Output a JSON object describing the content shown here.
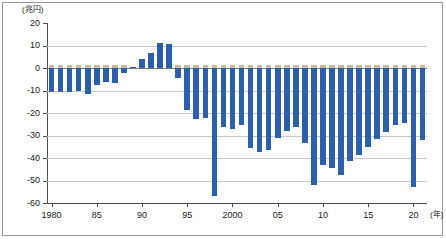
{
  "figure": {
    "unit_label": "(兆円)",
    "x_unit_label": "(年)"
  },
  "axes": {
    "y_ticks": [
      20,
      10,
      0,
      -10,
      -20,
      -30,
      -40,
      -50,
      -60
    ],
    "y_tick_labels": [
      "20",
      "10",
      "0",
      "-10",
      "-20",
      "-30",
      "-40",
      "-50",
      "-60"
    ],
    "x_tick_labels": [
      "1980",
      "85",
      "90",
      "95",
      "2000",
      "05",
      "10",
      "15",
      "20"
    ],
    "x_tick_years": [
      1980,
      1985,
      1990,
      1995,
      2000,
      2005,
      2010,
      2015,
      2020
    ]
  },
  "colors": {
    "bar": "#2b5faa",
    "grid": "#c9c9c9",
    "axis": "#4d4d4d",
    "frame": "#9a9a9a",
    "background": "#ffffff"
  },
  "chart_data": {
    "type": "bar",
    "title": "",
    "subtitle": "",
    "xlabel": "(年)",
    "ylabel": "(兆円)",
    "ylim": [
      -60,
      20
    ],
    "grid": true,
    "legend": "none",
    "categories": [
      "1980",
      "1981",
      "1982",
      "1983",
      "1984",
      "1985",
      "1986",
      "1987",
      "1988",
      "1989",
      "1990",
      "1991",
      "1992",
      "1993",
      "1994",
      "1995",
      "1996",
      "1997",
      "1998",
      "1999",
      "2000",
      "2001",
      "2002",
      "2003",
      "2004",
      "2005",
      "2006",
      "2007",
      "2008",
      "2009",
      "2010",
      "2011",
      "2012",
      "2013",
      "2014",
      "2015",
      "2016",
      "2017",
      "2018",
      "2019",
      "2020",
      "2021"
    ],
    "values": [
      -10.5,
      -10.5,
      -10.5,
      -10.0,
      -11.5,
      -7.5,
      -6.0,
      -6.5,
      -2.0,
      0.5,
      4.0,
      6.5,
      11.0,
      10.8,
      -4.5,
      -18.5,
      -22.5,
      -22.0,
      -57.0,
      -26.0,
      -27.0,
      -25.5,
      -35.5,
      -37.5,
      -36.5,
      -31.0,
      -28.0,
      -26.0,
      -33.5,
      -52.0,
      -43.0,
      -44.5,
      -47.5,
      -41.5,
      -38.5,
      -35.0,
      -31.5,
      -28.5,
      -25.5,
      -24.5,
      -53.0,
      -32.0
    ],
    "series_name": "一般会計 財政収支"
  }
}
